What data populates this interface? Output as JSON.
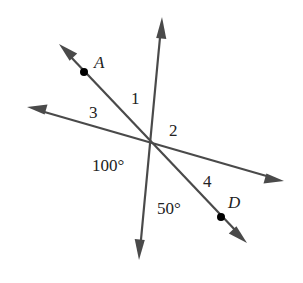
{
  "figure": {
    "type": "intersecting-lines",
    "intersection": {
      "x": 151,
      "y": 143
    },
    "colors": {
      "line": "#4a4a4a",
      "point": "#000000",
      "text": "#222222",
      "background": "#ffffff"
    },
    "lines": [
      {
        "id": "vertical",
        "from": {
          "x": 139,
          "y": 260
        },
        "to": {
          "x": 162,
          "y": 17
        },
        "arrows": "both"
      },
      {
        "id": "shallow",
        "from": {
          "x": 27,
          "y": 107
        },
        "to": {
          "x": 284,
          "y": 181
        },
        "arrows": "both"
      },
      {
        "id": "diagonal-AD",
        "from": {
          "x": 59,
          "y": 44
        },
        "to": {
          "x": 247,
          "y": 243
        },
        "arrows": "both"
      }
    ],
    "points": [
      {
        "name": "A",
        "x": 84,
        "y": 72
      },
      {
        "name": "D",
        "x": 221,
        "y": 217
      }
    ],
    "labels": {
      "point_a": "A",
      "point_d": "D",
      "angle_1": "1",
      "angle_2": "2",
      "angle_3": "3",
      "angle_4": "4",
      "angle_100": "100°",
      "angle_50": "50°"
    }
  }
}
